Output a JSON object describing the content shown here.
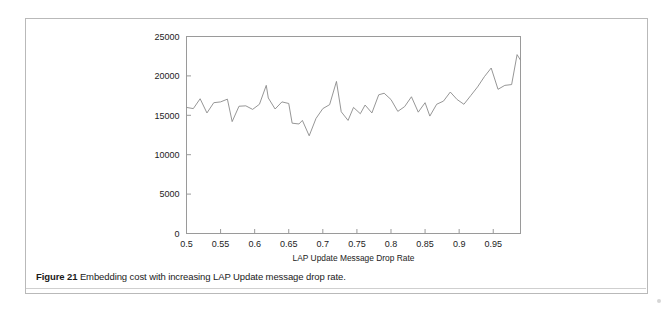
{
  "figure": {
    "caption_number": "Figure 21",
    "caption_text": " Embedding cost with increasing LAP Update message drop rate."
  },
  "chart_data": {
    "type": "line",
    "title": "",
    "subtitle": "",
    "xlabel": "LAP Update Message Drop Rate",
    "ylabel": "",
    "xlim": [
      0.5,
      0.99
    ],
    "ylim": [
      0,
      25000
    ],
    "grid": false,
    "legend": false,
    "legend_position": "none",
    "line_color": "#8a8a8a",
    "line_width": 0.9,
    "axis_color": "#9a9a9a",
    "xticks": [
      0.5,
      0.55,
      0.6,
      0.65,
      0.7,
      0.75,
      0.8,
      0.85,
      0.9,
      0.95
    ],
    "xtick_labels": [
      "0.5",
      "0.55",
      "0.6",
      "0.65",
      "0.7",
      "0.75",
      "0.8",
      "0.85",
      "0.9",
      "0.95"
    ],
    "yticks": [
      0,
      5000,
      10000,
      15000,
      20000,
      25000
    ],
    "ytick_labels": [
      "0",
      "5000",
      "10000",
      "15000",
      "20000",
      "25000"
    ],
    "series": [
      {
        "name": "Embedding cost",
        "x": [
          0.5,
          0.51,
          0.52,
          0.53,
          0.54,
          0.55,
          0.56,
          0.567,
          0.577,
          0.587,
          0.597,
          0.607,
          0.617,
          0.62,
          0.63,
          0.64,
          0.65,
          0.655,
          0.665,
          0.67,
          0.68,
          0.69,
          0.7,
          0.71,
          0.72,
          0.727,
          0.737,
          0.745,
          0.755,
          0.762,
          0.772,
          0.782,
          0.79,
          0.8,
          0.81,
          0.82,
          0.83,
          0.84,
          0.85,
          0.857,
          0.867,
          0.877,
          0.887,
          0.897,
          0.907,
          0.917,
          0.927,
          0.937,
          0.947,
          0.957,
          0.967,
          0.977,
          0.985,
          0.99
        ],
        "values": [
          16000,
          15850,
          17100,
          15300,
          16600,
          16700,
          17050,
          14200,
          16150,
          16200,
          15750,
          16400,
          18800,
          17200,
          15800,
          16700,
          16500,
          14000,
          13900,
          14350,
          12400,
          14600,
          15850,
          16350,
          19300,
          15450,
          14350,
          16000,
          15200,
          16300,
          15300,
          17600,
          17800,
          17000,
          15500,
          16100,
          17350,
          15400,
          16600,
          14900,
          16400,
          16800,
          17950,
          17000,
          16400,
          17500,
          18600,
          19900,
          21000,
          18300,
          18800,
          18900,
          22700,
          22000
        ]
      }
    ]
  },
  "axis": {
    "x_title": "LAP Update Message Drop Rate"
  }
}
